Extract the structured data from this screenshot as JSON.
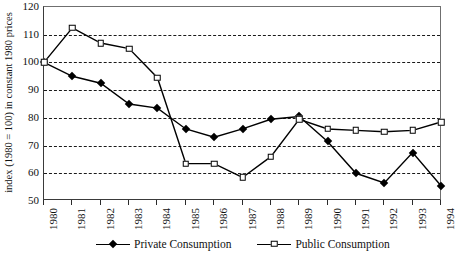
{
  "chart_data": {
    "type": "line",
    "title": "",
    "xlabel": "",
    "ylabel": "index (1980 = 100) in constant 1980 prices",
    "categories": [
      "1980",
      "1981",
      "1982",
      "1983",
      "1984",
      "1985",
      "1986",
      "1987",
      "1988",
      "1989",
      "1990",
      "1991",
      "1992",
      "1993",
      "1994"
    ],
    "ylim": [
      50,
      120
    ],
    "yticks": [
      50,
      60,
      70,
      80,
      90,
      100,
      110,
      120
    ],
    "grid": true,
    "legend_position": "bottom",
    "series": [
      {
        "name": "Private Consumption",
        "marker": "filled-diamond",
        "values": [
          100,
          95,
          92.5,
          85,
          83.5,
          76,
          73,
          76,
          79.5,
          80.5,
          71.5,
          60,
          56.5,
          67.5,
          55.5
        ]
      },
      {
        "name": "Public Consumption",
        "marker": "open-square",
        "values": [
          100,
          112.5,
          107,
          105,
          94.5,
          63.5,
          63.5,
          58.5,
          66,
          79.5,
          76,
          75.5,
          75,
          75.5,
          78.5
        ]
      }
    ]
  },
  "legend": {
    "entries": [
      {
        "label": "Private Consumption"
      },
      {
        "label": "Public Consumption"
      }
    ]
  }
}
